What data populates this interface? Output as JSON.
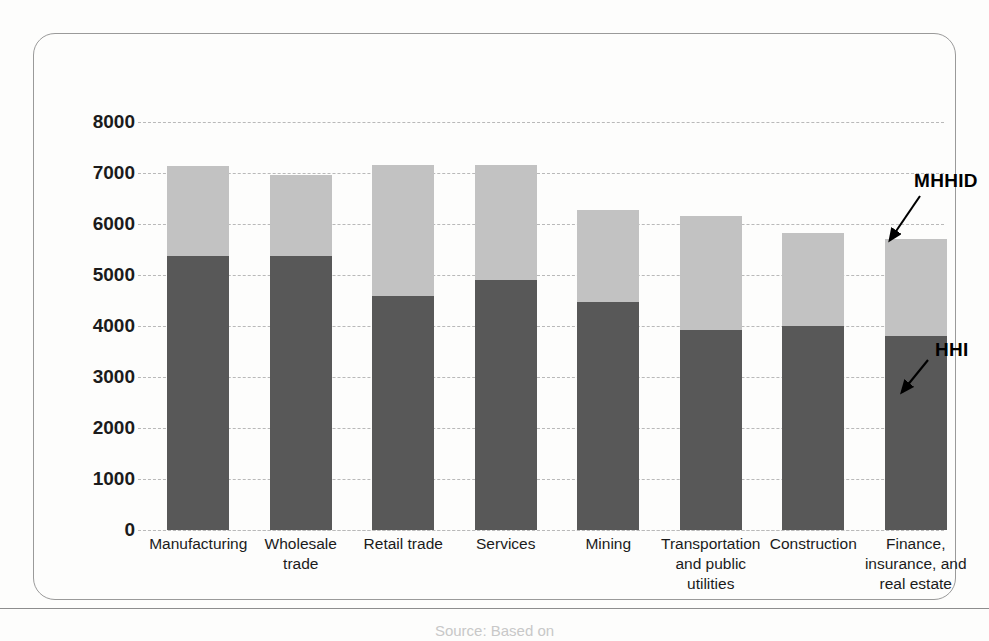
{
  "chart_data": {
    "type": "bar",
    "subtype": "stacked-vertical",
    "title": "",
    "xlabel": "",
    "ylabel": "",
    "ylim": [
      0,
      8000
    ],
    "ytick_step": 1000,
    "yticks": [
      "8000",
      "7000",
      "6000",
      "5000",
      "4000",
      "3000",
      "2000",
      "1000",
      "0"
    ],
    "grid": true,
    "grid_style": "dashed-horizontal",
    "legend_position": "annotations-right",
    "categories": [
      "Manufacturing",
      "Wholesale trade",
      "Retail trade",
      "Services",
      "Mining",
      "Transportation and public utilities",
      "Construction",
      "Finance, insurance, and real estate"
    ],
    "category_label_lines": [
      [
        "Manufacturing"
      ],
      [
        "Wholesale",
        "trade"
      ],
      [
        "Retail trade"
      ],
      [
        "Services"
      ],
      [
        "Mining"
      ],
      [
        "Transportation",
        "and public",
        "utilities"
      ],
      [
        "Construction"
      ],
      [
        "Finance,",
        "insurance, and",
        "real estate"
      ]
    ],
    "series": [
      {
        "name": "HHI",
        "color": "#585858",
        "values": [
          5370,
          5380,
          4580,
          4910,
          4470,
          3920,
          4000,
          3800
        ]
      },
      {
        "name": "MHHID",
        "color": "#c2c2c2",
        "values": [
          1770,
          1580,
          2570,
          2240,
          1800,
          2240,
          1820,
          1900
        ]
      }
    ],
    "totals": [
      7140,
      6960,
      7150,
      7150,
      6270,
      6160,
      5820,
      5700
    ],
    "annotations": [
      {
        "text": "MHHID",
        "points_to": "top-light-segment-of-last-bar"
      },
      {
        "text": "HHI",
        "points_to": "dark-segment-of-last-bar"
      }
    ]
  },
  "annotations": {
    "mhhid": "MHHID",
    "hhi": "HHI"
  },
  "footer": {
    "source_note": "Source: Based on"
  }
}
